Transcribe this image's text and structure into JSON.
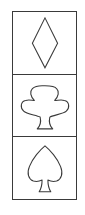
{
  "panel": {
    "cells": [
      {
        "symbol": "diamond",
        "icon": "diamond-icon",
        "label": "Diamond"
      },
      {
        "symbol": "club",
        "icon": "club-icon",
        "label": "Club"
      },
      {
        "symbol": "spade",
        "icon": "spade-icon",
        "label": "Spade"
      }
    ]
  },
  "colors": {
    "stroke": "#3a3a3a",
    "background": "#ffffff"
  }
}
